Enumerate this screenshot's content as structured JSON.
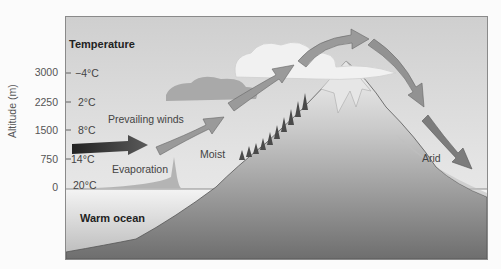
{
  "diagram": {
    "y_axis": {
      "title": "Altitude (m)",
      "ticks": [
        {
          "altitude": "3000",
          "temperature": "−4°C"
        },
        {
          "altitude": "2250",
          "temperature": "2°C"
        },
        {
          "altitude": "1500",
          "temperature": "8°C"
        },
        {
          "altitude": "750",
          "temperature": "14°C"
        },
        {
          "altitude": "0",
          "temperature": "20°C"
        }
      ]
    },
    "temperature_heading": "Temperature",
    "labels": {
      "prevailing_winds": "Prevailing winds",
      "evaporation": "Evaporation",
      "moist": "Moist",
      "arid": "Arid",
      "warm_ocean": "Warm ocean"
    },
    "colors": {
      "sky": "#d6d6d6",
      "mountain": "#9a9a9a",
      "arrow_dark": "#2e2e2e",
      "arrow_light": "#9c9c9c"
    }
  }
}
